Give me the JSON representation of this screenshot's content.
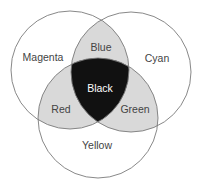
{
  "diagram": {
    "type": "venn",
    "title": "",
    "colors": {
      "background": "#ffffff",
      "stroke": "#7a7a7a",
      "pair_overlap": "#d9d9d9",
      "triple_overlap": "#111111"
    },
    "circles": [
      {
        "label": "Magenta",
        "cx": 70,
        "cy": 70,
        "r": 59
      },
      {
        "label": "Cyan",
        "cx": 131,
        "cy": 72,
        "r": 60
      },
      {
        "label": "Yellow",
        "cx": 98,
        "cy": 118,
        "r": 60
      }
    ],
    "regions": {
      "magenta": "Magenta",
      "cyan": "Cyan",
      "yellow": "Yellow",
      "blue": "Blue",
      "red": "Red",
      "green": "Green",
      "black": "Black"
    }
  }
}
